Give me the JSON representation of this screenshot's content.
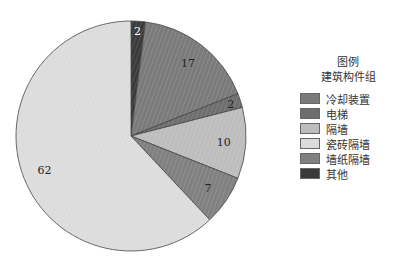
{
  "chart_data": {
    "type": "pie",
    "title": "",
    "legend_title": [
      "图例",
      "建筑构件组"
    ],
    "legend_position": "right",
    "start_angle_deg": 0,
    "direction": "clockwise",
    "slices": [
      {
        "label": "其他",
        "value": 2,
        "color": "#3a3a3a"
      },
      {
        "label": "冷却装置",
        "value": 17,
        "color": "#7a7a7a"
      },
      {
        "label": "电梯",
        "value": 2,
        "color": "#6e6e6e"
      },
      {
        "label": "隔墙",
        "value": 10,
        "color": "#bdbdbd"
      },
      {
        "label": "墙纸隔墙",
        "value": 7,
        "color": "#808080"
      },
      {
        "label": "瓷砖隔墙",
        "value": 62,
        "color": "#dcdcdc"
      }
    ]
  },
  "legend": {
    "title_line1": "图例",
    "title_line2": "建筑构件组",
    "items": [
      {
        "label": "冷却装置",
        "color": "#7a7a7a"
      },
      {
        "label": "电梯",
        "color": "#6e6e6e"
      },
      {
        "label": "隔墙",
        "color": "#bdbdbd"
      },
      {
        "label": "瓷砖隔墙",
        "color": "#dcdcdc"
      },
      {
        "label": "墙纸隔墙",
        "color": "#808080"
      },
      {
        "label": "其他",
        "color": "#3a3a3a"
      }
    ]
  }
}
